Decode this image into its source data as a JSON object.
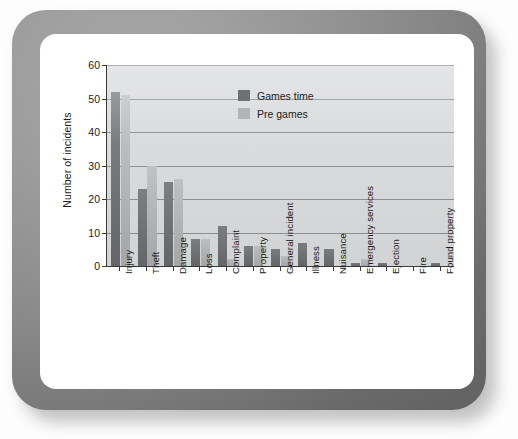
{
  "chart_data": {
    "type": "bar",
    "title": "",
    "subtitle": "",
    "xlabel": "",
    "ylabel": "Number of incidents",
    "ylim": [
      0,
      60
    ],
    "ytick_step": 10,
    "yticks": [
      0,
      10,
      20,
      30,
      40,
      50,
      60
    ],
    "grid": "horizontal",
    "legend_position": "inside-top-right",
    "categories": [
      "Injury",
      "Theft",
      "Damage",
      "Loss",
      "Complaint",
      "Property",
      "General incident",
      "Illness",
      "Nuisance",
      "Emergency services",
      "Ejection",
      "Fire",
      "Found property"
    ],
    "series": [
      {
        "name": "Games time",
        "color": "#6e7073",
        "values": [
          52,
          23,
          25,
          8,
          12,
          6,
          5,
          7,
          5,
          1,
          1,
          0,
          1
        ]
      },
      {
        "name": "Pre games",
        "color": "#b2b4b5",
        "values": [
          51,
          30,
          26,
          8,
          2,
          6,
          3,
          0,
          0,
          2,
          0,
          0,
          0
        ]
      }
    ]
  },
  "figure": {
    "plot_background": "#d9dadb",
    "axis_color": "#3a3a3a",
    "gridline_color": "#8d8f90"
  },
  "frame": {
    "bezel_color": "#8e8e8e",
    "card_color": "#ffffff"
  }
}
